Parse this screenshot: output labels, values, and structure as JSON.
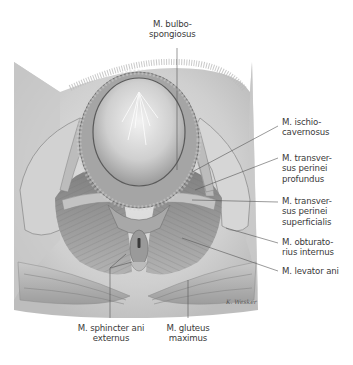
{
  "figure": {
    "type": "anatomical-illustration",
    "palette": {
      "background": "#ffffff",
      "skin": "#d8d8d8",
      "shadow": "#8a8a8a",
      "muscle": "#a9a9a9",
      "leader": "#555555",
      "text": "#3a3a3a"
    },
    "signature": "K. Wesker"
  },
  "labels": [
    {
      "id": "bulbospongiosus",
      "lines": [
        "M. bulbo-",
        "spongiosus"
      ]
    },
    {
      "id": "ischiocavernosus",
      "lines": [
        "M. ischio-",
        "cavernosus"
      ]
    },
    {
      "id": "transversus-profundus",
      "lines": [
        "M. transver-",
        "sus perinei",
        "profundus"
      ]
    },
    {
      "id": "transversus-superficialis",
      "lines": [
        "M. transver-",
        "sus perinei",
        "superficialis"
      ]
    },
    {
      "id": "obturatorius-internus",
      "lines": [
        "M. obturato-",
        "rius internus"
      ]
    },
    {
      "id": "levator-ani",
      "lines": [
        "M. levator ani"
      ]
    },
    {
      "id": "sphincter-ani-externus",
      "lines": [
        "M. sphincter ani",
        "externus"
      ]
    },
    {
      "id": "gluteus-maximus",
      "lines": [
        "M. gluteus",
        "maximus"
      ]
    }
  ]
}
